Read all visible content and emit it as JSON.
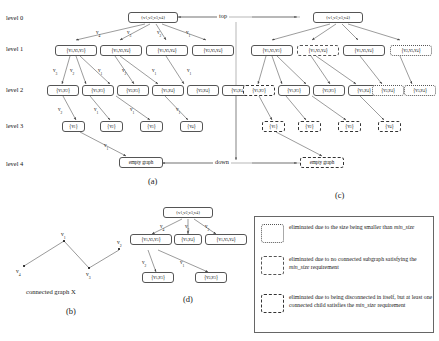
{
  "levels": [
    "level 0",
    "level 1",
    "level 2",
    "level 3",
    "level 4"
  ],
  "flow": {
    "top": "top",
    "down": "down"
  },
  "panels": {
    "a": "(a)",
    "b": "(b)",
    "c": "(c)",
    "d": "(d)"
  },
  "captions": {
    "graph_x": "connected graph X"
  },
  "panel_a": {
    "level0": [
      "{v1,v2,v3,v4}"
    ],
    "level1": [
      "{v1,v2,v3}",
      "{v1,v2,v4}",
      "{v1,v3,v4}",
      "{v2,v3,v4}"
    ],
    "level2": [
      "{v1,v2}",
      "{v1,v3}",
      "{v2,v3}",
      "{v1,v4}",
      "{v2,v4}",
      "{v3,v4}"
    ],
    "level3": [
      "{v1}",
      "{v2}",
      "{v3}",
      "{v4}"
    ],
    "level4": [
      "empty graph"
    ],
    "edge_labels_0_1": [
      "v4",
      "v3",
      "v2",
      "v1"
    ],
    "edge_labels_1_2": [
      "v3",
      "v2",
      "v1",
      "v2",
      "v1",
      "v1"
    ],
    "edge_labels_2_3": [
      "v2",
      "v1",
      "v1",
      "v1"
    ],
    "edge_labels_3_4": [
      "v1"
    ]
  },
  "panel_c": {
    "level0": [
      "{v1,v2,v3,v4}"
    ],
    "level1": [
      "{v1,v2,v3}",
      "{v1,v2,v4}",
      "{v1,v3,v4}",
      "{v2,v3,v4}"
    ],
    "level1_styles": [
      "solid",
      "dashed",
      "solid",
      "dotted"
    ],
    "level2": [
      "{v1,v2}",
      "{v1,v3}",
      "{v2,v3}",
      "{v1,v4}",
      "{v2,v4}",
      "{v3,v4}"
    ],
    "level2_styles": [
      "dashdot",
      "solid",
      "solid",
      "solid",
      "dotted",
      "dotted"
    ],
    "level3": [
      "{v1}",
      "{v2}",
      "{v3}",
      "{v4}"
    ],
    "level3_styles": [
      "dashdot",
      "dashdot",
      "dashdot",
      "dashdot"
    ],
    "level4": [
      "empty graph"
    ],
    "level4_styles": [
      "dashdot"
    ]
  },
  "panel_b": {
    "vertices": [
      {
        "id": "v1",
        "label": "v1",
        "x": 63,
        "y": 238
      },
      {
        "id": "v2",
        "label": "v2",
        "x": 119,
        "y": 248
      },
      {
        "id": "v3",
        "label": "v3",
        "x": 89,
        "y": 268
      },
      {
        "id": "v4",
        "label": "v4",
        "x": 22,
        "y": 266
      }
    ],
    "edges": [
      [
        "v1",
        "v4"
      ],
      [
        "v1",
        "v3"
      ],
      [
        "v3",
        "v2"
      ]
    ]
  },
  "panel_d": {
    "level0": [
      "{v1,v2,v3,v4}"
    ],
    "level1": [
      "{v1,v2,v3}",
      "{v1,v4}",
      "{v1,v3,v4}"
    ],
    "level2": [
      "{v1,v3}",
      "{v2,v3}"
    ],
    "edge_labels_0_1": [
      "v4",
      "v3",
      "v2"
    ],
    "edge_labels_1_2": [
      "v2",
      "v1"
    ]
  },
  "legend": {
    "items": [
      {
        "style": "dotted",
        "text": "eliminated due to the size being smaller than ",
        "em": "min_size",
        "tail": ""
      },
      {
        "style": "dashed",
        "text": "eliminated due to no connected subgraph satisfying the ",
        "em": "min_size",
        "tail": " requirement"
      },
      {
        "style": "dashdot",
        "text": "eliminated due to being disconnected in itself, but at least one connected child satisfies the ",
        "em": "min_size",
        "tail": " requirement"
      }
    ]
  }
}
